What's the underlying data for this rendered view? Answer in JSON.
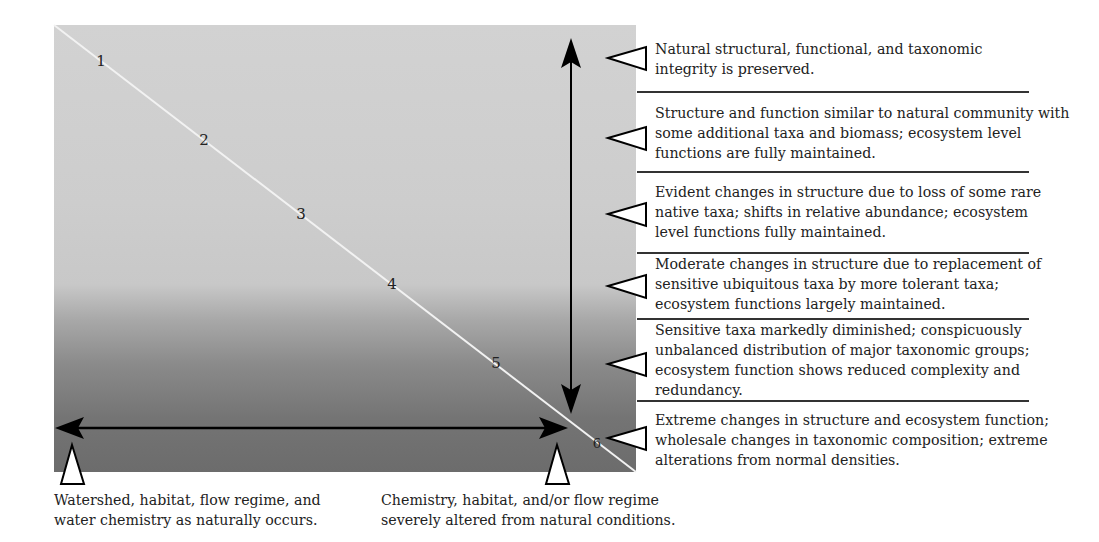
{
  "diagram": {
    "type": "biological-condition-gradient",
    "levels": [
      {
        "number": "1",
        "description": "Natural structural, functional, and taxonomic integrity is preserved."
      },
      {
        "number": "2",
        "description": "Structure and function similar to natural community with some additional taxa and biomass; ecosystem level functions are fully maintained."
      },
      {
        "number": "3",
        "description": "Evident changes in structure due to loss of some rare native taxa; shifts in relative abundance; ecosystem level functions fully maintained."
      },
      {
        "number": "4",
        "description": "Moderate changes in structure due to replacement of sensitive ubiquitous taxa by more tolerant taxa; ecosystem functions largely maintained."
      },
      {
        "number": "5",
        "description": "Sensitive taxa markedly diminished; conspicuously unbalanced distribution of major taxonomic groups; ecosystem function shows reduced complexity and redundancy."
      },
      {
        "number": "6",
        "description": "Extreme changes in structure and ecosystem function; wholesale changes in taxonomic composition; extreme alterations from normal densities."
      }
    ],
    "x_axis": {
      "left_caption": "Watershed, habitat, flow regime, and water chemistry as naturally occurs.",
      "right_caption": "Chemistry, habitat, and/or flow regime severely altered from natural conditions."
    },
    "colors": {
      "gradient_top": "#d2d2d2",
      "gradient_bottom": "#6c6c6c",
      "diagonal_line": "#f2f2f2",
      "arrows": "#000000"
    }
  }
}
